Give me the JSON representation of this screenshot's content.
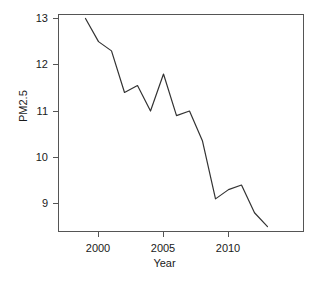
{
  "chart_data": {
    "type": "line",
    "title": "",
    "xlabel": "Year",
    "ylabel": "PM2.5",
    "x": [
      1999,
      2000,
      2001,
      2002,
      2003,
      2004,
      2005,
      2006,
      2007,
      2008,
      2009,
      2010,
      2011,
      2012,
      2013
    ],
    "values": [
      13.0,
      12.5,
      12.3,
      11.4,
      11.55,
      11.0,
      11.8,
      10.9,
      11.0,
      10.35,
      9.1,
      9.3,
      9.4,
      8.8,
      8.5
    ],
    "series": [
      {
        "name": "PM2.5",
        "values": [
          13.0,
          12.5,
          12.3,
          11.4,
          11.55,
          11.0,
          11.8,
          10.9,
          11.0,
          10.35,
          9.1,
          9.3,
          9.4,
          8.8,
          8.5
        ]
      }
    ],
    "xlim": [
      1998.6,
      1998.6
    ],
    "ylim": [
      8.4,
      13.1
    ],
    "x_ticks": [
      2000,
      2005,
      2010
    ],
    "x_tick_labels": [
      "2000",
      "2005",
      "2010"
    ],
    "y_ticks": [
      9,
      10,
      11,
      12,
      13
    ],
    "y_tick_labels": [
      "9",
      "10",
      "11",
      "12",
      "13"
    ],
    "grid": false,
    "legend": "none",
    "line_color": "#333333",
    "axis_color": "#555555",
    "background_color": "#ffffff"
  },
  "axes": {
    "y_title": "PM2.5",
    "x_title": "Year"
  },
  "y_tick_labels": [
    "13",
    "12",
    "11",
    "10",
    "9"
  ],
  "x_tick_labels": [
    "2000",
    "2005",
    "2010"
  ]
}
